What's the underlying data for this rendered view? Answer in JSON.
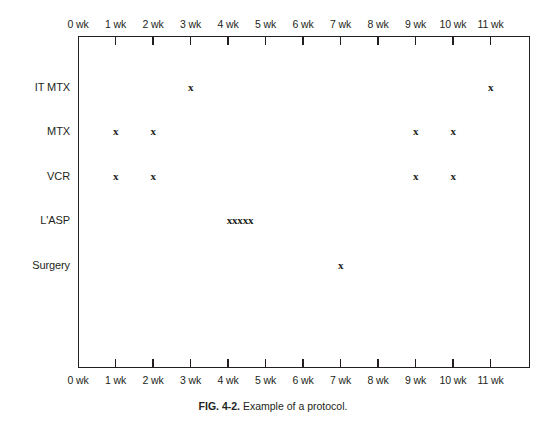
{
  "figure": {
    "caption_label": "FIG. 4-2.",
    "caption_text": "Example of a protocol.",
    "top_sliver_text": "",
    "frame_color": "#231f20",
    "background_color": "#ffffff"
  },
  "chart_data": {
    "type": "scatter",
    "title": "Example of a protocol.",
    "xlabel": "",
    "ylabel": "",
    "xlim": [
      0,
      11.9
    ],
    "grid": false,
    "legend": null,
    "axis_duplicated_top_and_bottom": true,
    "x_tick_labels": [
      "0 wk",
      "1 wk",
      "2 wk",
      "3 wk",
      "4 wk",
      "5 wk",
      "6 wk",
      "7 wk",
      "8 wk",
      "9 wk",
      "10 wk",
      "11 wk"
    ],
    "x_tick_values": [
      0,
      1,
      2,
      3,
      4,
      5,
      6,
      7,
      8,
      9,
      10,
      11
    ],
    "categories": [
      "IT MTX",
      "MTX",
      "VCR",
      "L'ASP",
      "Surgery"
    ],
    "marker_symbol": "x",
    "series": [
      {
        "name": "IT MTX",
        "row": 0,
        "x": [
          3,
          11
        ],
        "marker_labels": [
          "x",
          "x"
        ]
      },
      {
        "name": "MTX",
        "row": 1,
        "x": [
          1,
          2,
          9,
          10
        ],
        "marker_labels": [
          "x",
          "x",
          "x",
          "x"
        ]
      },
      {
        "name": "VCR",
        "row": 2,
        "x": [
          1,
          2,
          9,
          10
        ],
        "marker_labels": [
          "x",
          "x",
          "x",
          "x"
        ]
      },
      {
        "name": "L'ASP",
        "row": 3,
        "x": [
          4
        ],
        "marker_labels": [
          "xxxxx"
        ],
        "note": "five consecutive doses"
      },
      {
        "name": "Surgery",
        "row": 4,
        "x": [
          7
        ],
        "marker_labels": [
          "x"
        ]
      }
    ]
  },
  "rows": [
    {
      "label": "IT MTX"
    },
    {
      "label": "MTX"
    },
    {
      "label": "VCR"
    },
    {
      "label": "L'ASP"
    },
    {
      "label": "Surgery"
    }
  ],
  "markers": [
    {
      "row": 0,
      "week": 3,
      "text": "x"
    },
    {
      "row": 0,
      "week": 11,
      "text": "x"
    },
    {
      "row": 1,
      "week": 1,
      "text": "x"
    },
    {
      "row": 1,
      "week": 2,
      "text": "x"
    },
    {
      "row": 1,
      "week": 9,
      "text": "x"
    },
    {
      "row": 1,
      "week": 10,
      "text": "x"
    },
    {
      "row": 2,
      "week": 1,
      "text": "x"
    },
    {
      "row": 2,
      "week": 2,
      "text": "x"
    },
    {
      "row": 2,
      "week": 9,
      "text": "x"
    },
    {
      "row": 2,
      "week": 10,
      "text": "x"
    },
    {
      "row": 3,
      "week": 4,
      "text": "xxxxx",
      "cluster": true
    },
    {
      "row": 4,
      "week": 7,
      "text": "x"
    }
  ]
}
